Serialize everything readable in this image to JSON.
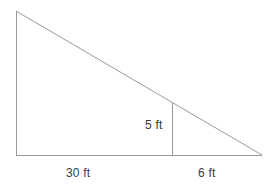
{
  "figure": {
    "kind": "right-triangle-similar-triangles-diagram",
    "background_color": "#ffffff",
    "stroke_color": "#9a9a9a",
    "text_color": "#3b3b3b",
    "stroke_width": 1,
    "labels": {
      "height_inner": "5 ft",
      "base_left": "30 ft",
      "base_right": "6 ft"
    },
    "geometry": {
      "apex": {
        "x": 16,
        "y": 11
      },
      "bottom_left": {
        "x": 16,
        "y": 155
      },
      "bottom_right": {
        "x": 262,
        "y": 155
      },
      "inner_vertical_top": {
        "x": 172,
        "y": 103
      },
      "inner_vertical_bottom": {
        "x": 172,
        "y": 155
      }
    }
  }
}
